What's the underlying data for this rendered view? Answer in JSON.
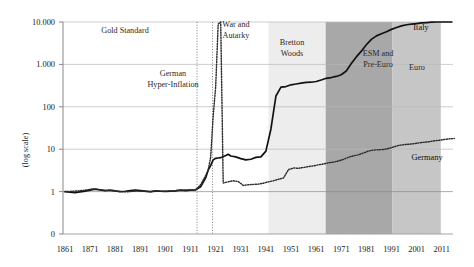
{
  "chart_data": {
    "type": "line",
    "title": "",
    "subtitle": "",
    "xlabel": "",
    "ylabel": "(log scale)",
    "grid": true,
    "legend_position": "inline-labels",
    "xlim": [
      1861,
      2016
    ],
    "ylim_labels": [
      "0",
      "1",
      "10",
      "100",
      "1.000",
      "10.000"
    ],
    "y_ticks": [
      "10.000",
      "1.000",
      "100",
      "10",
      "1",
      "0"
    ],
    "x_ticks": [
      "1861",
      "1871",
      "1881",
      "1891",
      "1901",
      "1911",
      "1921",
      "1931",
      "1941",
      "1951",
      "1961",
      "1971",
      "1981",
      "1991",
      "2001",
      "2011"
    ],
    "series": [
      {
        "name": "Italy",
        "style": "solid",
        "color": "#121212",
        "points": [
          [
            1861,
            1.0
          ],
          [
            1863,
            0.97
          ],
          [
            1865,
            0.95
          ],
          [
            1867,
            0.99
          ],
          [
            1869,
            1.03
          ],
          [
            1871,
            1.08
          ],
          [
            1873,
            1.14
          ],
          [
            1875,
            1.1
          ],
          [
            1877,
            1.05
          ],
          [
            1879,
            1.09
          ],
          [
            1881,
            1.04
          ],
          [
            1883,
            1.0
          ],
          [
            1885,
            1.02
          ],
          [
            1887,
            1.05
          ],
          [
            1889,
            1.08
          ],
          [
            1891,
            1.06
          ],
          [
            1893,
            1.03
          ],
          [
            1895,
            1.0
          ],
          [
            1897,
            1.04
          ],
          [
            1899,
            1.02
          ],
          [
            1901,
            1.01
          ],
          [
            1903,
            1.03
          ],
          [
            1905,
            1.04
          ],
          [
            1907,
            1.08
          ],
          [
            1909,
            1.06
          ],
          [
            1911,
            1.08
          ],
          [
            1913,
            1.1
          ],
          [
            1915,
            1.3
          ],
          [
            1917,
            2.1
          ],
          [
            1918,
            3.2
          ],
          [
            1919,
            4.1
          ],
          [
            1920,
            5.6
          ],
          [
            1921,
            6.1
          ],
          [
            1922,
            6.2
          ],
          [
            1923,
            6.3
          ],
          [
            1925,
            7.1
          ],
          [
            1926,
            7.6
          ],
          [
            1927,
            6.9
          ],
          [
            1929,
            6.6
          ],
          [
            1931,
            6.0
          ],
          [
            1933,
            5.6
          ],
          [
            1935,
            5.8
          ],
          [
            1937,
            6.4
          ],
          [
            1939,
            6.6
          ],
          [
            1941,
            9.0
          ],
          [
            1943,
            30.0
          ],
          [
            1945,
            180.0
          ],
          [
            1947,
            290.0
          ],
          [
            1949,
            300.0
          ],
          [
            1951,
            330.0
          ],
          [
            1953,
            345.0
          ],
          [
            1955,
            360.0
          ],
          [
            1957,
            375.0
          ],
          [
            1959,
            380.0
          ],
          [
            1961,
            395.0
          ],
          [
            1963,
            430.0
          ],
          [
            1965,
            470.0
          ],
          [
            1967,
            490.0
          ],
          [
            1969,
            520.0
          ],
          [
            1971,
            570.0
          ],
          [
            1973,
            700.0
          ],
          [
            1975,
            1050.0
          ],
          [
            1977,
            1500.0
          ],
          [
            1979,
            2050.0
          ],
          [
            1981,
            2900.0
          ],
          [
            1983,
            3900.0
          ],
          [
            1985,
            4700.0
          ],
          [
            1987,
            5300.0
          ],
          [
            1989,
            5900.0
          ],
          [
            1991,
            6700.0
          ],
          [
            1993,
            7400.0
          ],
          [
            1995,
            8100.0
          ],
          [
            1997,
            8600.0
          ],
          [
            1999,
            8900.0
          ],
          [
            2001,
            9200.0
          ],
          [
            2003,
            9500.0
          ],
          [
            2005,
            9700.0
          ],
          [
            2007,
            9900.0
          ],
          [
            2009,
            10000.0
          ],
          [
            2011,
            10200.0
          ],
          [
            2013,
            10400.0
          ],
          [
            2015,
            10500.0
          ]
        ]
      },
      {
        "name": "Germany",
        "style": "dotted",
        "color": "#2b2b2b",
        "points": [
          [
            1861,
            1.0
          ],
          [
            1864,
            1.02
          ],
          [
            1867,
            1.05
          ],
          [
            1870,
            1.1
          ],
          [
            1872,
            1.16
          ],
          [
            1874,
            1.12
          ],
          [
            1877,
            1.06
          ],
          [
            1880,
            1.04
          ],
          [
            1883,
            1.0
          ],
          [
            1886,
            0.99
          ],
          [
            1889,
            1.03
          ],
          [
            1892,
            1.02
          ],
          [
            1895,
            0.99
          ],
          [
            1898,
            1.03
          ],
          [
            1901,
            1.02
          ],
          [
            1904,
            1.04
          ],
          [
            1907,
            1.08
          ],
          [
            1910,
            1.09
          ],
          [
            1913,
            1.1
          ],
          [
            1915,
            1.45
          ],
          [
            1917,
            2.4
          ],
          [
            1918,
            3.2
          ],
          [
            1919,
            6.5
          ],
          [
            1920,
            60.0
          ],
          [
            1921,
            300.0
          ],
          [
            1922,
            9000.0
          ],
          [
            1923,
            10000.0
          ],
          [
            1924,
            1.6
          ],
          [
            1926,
            1.7
          ],
          [
            1928,
            1.8
          ],
          [
            1930,
            1.72
          ],
          [
            1932,
            1.4
          ],
          [
            1934,
            1.45
          ],
          [
            1936,
            1.48
          ],
          [
            1938,
            1.5
          ],
          [
            1940,
            1.58
          ],
          [
            1942,
            1.7
          ],
          [
            1944,
            1.8
          ],
          [
            1946,
            1.95
          ],
          [
            1948,
            2.1
          ],
          [
            1950,
            3.3
          ],
          [
            1952,
            3.6
          ],
          [
            1954,
            3.55
          ],
          [
            1956,
            3.7
          ],
          [
            1958,
            3.9
          ],
          [
            1960,
            4.05
          ],
          [
            1962,
            4.3
          ],
          [
            1964,
            4.5
          ],
          [
            1966,
            4.8
          ],
          [
            1968,
            4.95
          ],
          [
            1970,
            5.3
          ],
          [
            1972,
            5.8
          ],
          [
            1974,
            6.5
          ],
          [
            1976,
            7.0
          ],
          [
            1978,
            7.4
          ],
          [
            1980,
            8.2
          ],
          [
            1982,
            9.1
          ],
          [
            1984,
            9.6
          ],
          [
            1986,
            9.7
          ],
          [
            1988,
            9.9
          ],
          [
            1990,
            10.4
          ],
          [
            1992,
            11.4
          ],
          [
            1994,
            12.3
          ],
          [
            1996,
            12.8
          ],
          [
            1998,
            13.1
          ],
          [
            2000,
            13.5
          ],
          [
            2002,
            14.1
          ],
          [
            2004,
            14.6
          ],
          [
            2006,
            15.0
          ],
          [
            2008,
            15.8
          ],
          [
            2010,
            16.2
          ],
          [
            2012,
            17.0
          ],
          [
            2014,
            17.5
          ],
          [
            2016,
            17.9
          ]
        ]
      }
    ],
    "series_labels": [
      {
        "name": "Italy",
        "text": "Italy"
      },
      {
        "name": "Germany",
        "text": "Germany"
      }
    ],
    "bands": [
      {
        "name": "bretton-woods",
        "label": "Bretton Woods",
        "label_lines": [
          "Bretton",
          "Woods"
        ],
        "start": 1947,
        "end": 1971,
        "color": "#ededed"
      },
      {
        "name": "esm-pre-euro",
        "label": "ESM and Pre-Euro",
        "label_lines": [
          "ESM and",
          "Pre-Euro"
        ],
        "start": 1971,
        "end": 1999,
        "color": "#a8a8a8"
      },
      {
        "name": "euro",
        "label": "Euro",
        "label_lines": [
          "Euro"
        ],
        "start": 1999,
        "end": 2016,
        "color": "#c6c6c6"
      }
    ],
    "annotations": [
      {
        "name": "gold-standard",
        "lines": [
          "Gold Standard"
        ]
      },
      {
        "name": "german-hyper-inflation",
        "lines": [
          "German",
          "Hyper-Inflation"
        ]
      },
      {
        "name": "war-and-autarky",
        "lines": [
          "War and",
          "Autarky"
        ]
      }
    ],
    "vertical_markers": [
      {
        "name": "marker-1914",
        "year": 1914,
        "style": "dotted"
      },
      {
        "name": "marker-1920",
        "year": 1920,
        "style": "dotted"
      }
    ]
  }
}
